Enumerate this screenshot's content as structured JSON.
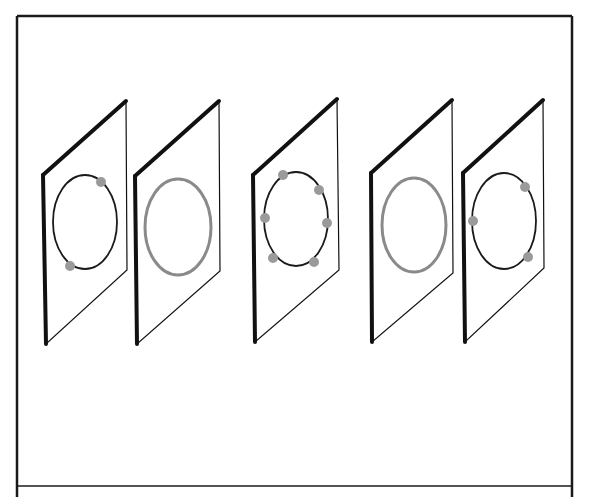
{
  "figure": {
    "frame": {
      "x": 17,
      "y": 16,
      "width": 555,
      "height": 490,
      "divider_y": 486,
      "stroke": "#1a1a1a"
    },
    "colors": {
      "panel_edge": "#111111",
      "ring_dark": "#1a1a1a",
      "ring_gray": "#8a8a8a",
      "dot": "#9a9a9a"
    },
    "panels": [
      {
        "id": "panel-1",
        "corners": {
          "tl": [
            43,
            175
          ],
          "tr": [
            126,
            101
          ],
          "br": [
            127,
            270
          ],
          "bl": [
            46,
            344
          ]
        },
        "ring": {
          "cx": 85,
          "cy": 222,
          "rx": 32,
          "ry": 47,
          "style": "dark"
        },
        "dots": [
          [
            101,
            182
          ],
          [
            70,
            266
          ]
        ]
      },
      {
        "id": "panel-2",
        "corners": {
          "tl": [
            135,
            176
          ],
          "tr": [
            219,
            101
          ],
          "br": [
            220,
            271
          ],
          "bl": [
            137,
            344
          ]
        },
        "ring": {
          "cx": 178,
          "cy": 227,
          "rx": 33,
          "ry": 48,
          "style": "gray"
        },
        "dots": []
      },
      {
        "id": "panel-3",
        "corners": {
          "tl": [
            253,
            175
          ],
          "tr": [
            337,
            99
          ],
          "br": [
            339,
            270
          ],
          "bl": [
            255,
            342
          ]
        },
        "ring": {
          "cx": 296,
          "cy": 219,
          "rx": 32,
          "ry": 47,
          "style": "dark"
        },
        "dots": [
          [
            283,
            175
          ],
          [
            319,
            190
          ],
          [
            265,
            218
          ],
          [
            327,
            223
          ],
          [
            273,
            258
          ],
          [
            314,
            262
          ]
        ]
      },
      {
        "id": "panel-4",
        "corners": {
          "tl": [
            371,
            173
          ],
          "tr": [
            452,
            100
          ],
          "br": [
            453,
            273
          ],
          "bl": [
            372,
            342
          ]
        },
        "ring": {
          "cx": 414,
          "cy": 225,
          "rx": 32,
          "ry": 47,
          "style": "gray"
        },
        "dots": []
      },
      {
        "id": "panel-5",
        "corners": {
          "tl": [
            463,
            173
          ],
          "tr": [
            543,
            100
          ],
          "br": [
            544,
            268
          ],
          "bl": [
            465,
            342
          ]
        },
        "ring": {
          "cx": 504,
          "cy": 221,
          "rx": 32,
          "ry": 48,
          "style": "dark"
        },
        "dots": [
          [
            525,
            187
          ],
          [
            473,
            221
          ],
          [
            528,
            257
          ]
        ]
      }
    ]
  }
}
